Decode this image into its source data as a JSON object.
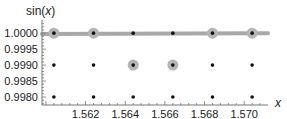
{
  "chart_data": {
    "type": "scatter",
    "title": "",
    "xlabel": "x",
    "ylabel": "sin(x)",
    "xlim": [
      1.5598,
      1.5712
    ],
    "ylim": [
      0.99775,
      1.00035
    ],
    "x_ticks": [
      "1.562",
      "1.564",
      "1.566",
      "1.568",
      "1.570"
    ],
    "x_tick_values": [
      1.562,
      1.564,
      1.566,
      1.568,
      1.57
    ],
    "y_ticks": [
      "1.0000",
      "0.9995",
      "0.9990",
      "0.9985",
      "0.9980"
    ],
    "y_tick_values": [
      1.0,
      0.9995,
      0.999,
      0.9985,
      0.998
    ],
    "grid": false,
    "series": [
      {
        "name": "lattice points",
        "x": [
          1.5604,
          1.5624,
          1.5644,
          1.5664,
          1.5684,
          1.5704
        ],
        "y_levels": [
          1.0,
          0.999,
          0.998
        ]
      },
      {
        "name": "sin(x) curve",
        "x": [
          1.5598,
          1.5708,
          1.5712
        ],
        "y": [
          0.99997,
          1.0,
          1.0
        ]
      },
      {
        "name": "highlighted points",
        "points": [
          {
            "x": 1.5604,
            "y": 1.0
          },
          {
            "x": 1.5624,
            "y": 1.0
          },
          {
            "x": 1.5644,
            "y": 0.999
          },
          {
            "x": 1.5664,
            "y": 0.999
          },
          {
            "x": 1.5684,
            "y": 1.0
          },
          {
            "x": 1.5704,
            "y": 1.0
          }
        ]
      }
    ],
    "colors": {
      "curve": "#a8a8a8",
      "highlight": "#b5b5b5",
      "dot": "#111111",
      "axis": "#777777"
    }
  }
}
